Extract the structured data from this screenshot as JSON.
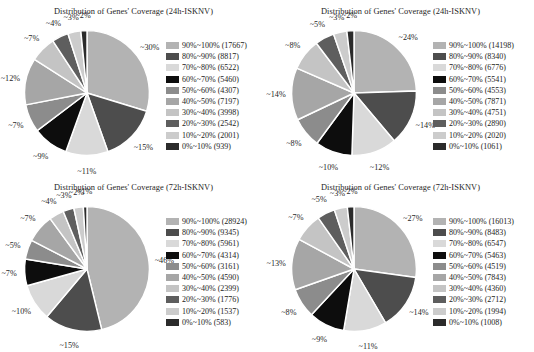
{
  "figure": {
    "background": "#ffffff",
    "label_prefix": "~",
    "panel_count": 4
  },
  "palette": {
    "c90_100": "#b3b3b3",
    "c80_90": "#4d4d4d",
    "c70_80": "#d9d9d9",
    "c60_70": "#0d0d0d",
    "c50_60": "#8c8c8c",
    "c40_50": "#a6a6a6",
    "c30_40": "#c4c4c4",
    "c20_30": "#5e5e5e",
    "c10_20": "#cccccc",
    "c0_10": "#2b2b2b"
  },
  "legend_categories": [
    "90%~100%",
    "80%~90%",
    "70%~80%",
    "60%~70%",
    "50%~60%",
    "40%~50%",
    "30%~40%",
    "20%~30%",
    "10%~20%",
    "0%~10%"
  ],
  "panels": [
    {
      "id": "panel-top-left",
      "title": "Distribution of Genes' Coverage (24h-ISKNV)",
      "legend": [
        {
          "label": "90%~100% (17667)",
          "color": "#b3b3b3"
        },
        {
          "label": "80%~90% (8817)",
          "color": "#4d4d4d"
        },
        {
          "label": "70%~80% (6522)",
          "color": "#d9d9d9"
        },
        {
          "label": "60%~70% (5460)",
          "color": "#0d0d0d"
        },
        {
          "label": "50%~60% (4307)",
          "color": "#8c8c8c"
        },
        {
          "label": "40%~50% (7197)",
          "color": "#a6a6a6"
        },
        {
          "label": "30%~40% (3998)",
          "color": "#c4c4c4"
        },
        {
          "label": "20%~30% (2542)",
          "color": "#5e5e5e"
        },
        {
          "label": "10%~20% (2001)",
          "color": "#cccccc"
        },
        {
          "label": "0%~10% (939)",
          "color": "#2b2b2b"
        }
      ],
      "slice_labels": [
        "~30%",
        "~2%",
        "~3%",
        "~4%",
        "~7%",
        "~12%",
        "~7%",
        "~9%",
        "~11%",
        "~15%"
      ]
    },
    {
      "id": "panel-top-right",
      "title": "Distribution of Genes' Coverage (24h-ISKNV)",
      "legend": [
        {
          "label": "90%~100% (14198)",
          "color": "#b3b3b3"
        },
        {
          "label": "80%~90% (8340)",
          "color": "#4d4d4d"
        },
        {
          "label": "70%~80% (6776)",
          "color": "#d9d9d9"
        },
        {
          "label": "60%~70% (5541)",
          "color": "#0d0d0d"
        },
        {
          "label": "50%~60% (4553)",
          "color": "#8c8c8c"
        },
        {
          "label": "40%~50% (7871)",
          "color": "#a6a6a6"
        },
        {
          "label": "30%~40% (4751)",
          "color": "#c4c4c4"
        },
        {
          "label": "20%~30% (2890)",
          "color": "#5e5e5e"
        },
        {
          "label": "10%~20% (2020)",
          "color": "#cccccc"
        },
        {
          "label": "0%~10% (1061)",
          "color": "#2b2b2b"
        }
      ],
      "slice_labels": [
        "~24%",
        "~2%",
        "~3%",
        "~5%",
        "~8%",
        "~14%",
        "~8%",
        "~10%",
        "~12%",
        "~14%"
      ]
    },
    {
      "id": "panel-bottom-left",
      "title": "Distribution of Genes' Coverage (72h-ISKNV)",
      "legend": [
        {
          "label": "90%~100% (28924)",
          "color": "#b3b3b3"
        },
        {
          "label": "80%~90% (9345)",
          "color": "#4d4d4d"
        },
        {
          "label": "70%~80% (5961)",
          "color": "#d9d9d9"
        },
        {
          "label": "60%~70% (4314)",
          "color": "#0d0d0d"
        },
        {
          "label": "50%~60% (3161)",
          "color": "#8c8c8c"
        },
        {
          "label": "40%~50% (4590)",
          "color": "#a6a6a6"
        },
        {
          "label": "30%~40% (2399)",
          "color": "#c4c4c4"
        },
        {
          "label": "20%~30% (1776)",
          "color": "#5e5e5e"
        },
        {
          "label": "10%~20% (1537)",
          "color": "#cccccc"
        },
        {
          "label": "0%~10% (583)",
          "color": "#2b2b2b"
        }
      ],
      "slice_labels": [
        "~46%",
        "~1%",
        "~2%",
        "~3%",
        "~4%",
        "~7%",
        "~5%",
        "~7%",
        "~10%",
        "~15%"
      ]
    },
    {
      "id": "panel-bottom-right",
      "title": "Distribution of Genes' Coverage (72h-ISKNV)",
      "legend": [
        {
          "label": "90%~100% (16013)",
          "color": "#b3b3b3"
        },
        {
          "label": "80%~90% (8483)",
          "color": "#4d4d4d"
        },
        {
          "label": "70%~80% (6547)",
          "color": "#d9d9d9"
        },
        {
          "label": "60%~70% (5463)",
          "color": "#0d0d0d"
        },
        {
          "label": "50%~60% (4519)",
          "color": "#8c8c8c"
        },
        {
          "label": "40%~50% (7843)",
          "color": "#a6a6a6"
        },
        {
          "label": "30%~40% (4360)",
          "color": "#c4c4c4"
        },
        {
          "label": "20%~30% (2712)",
          "color": "#5e5e5e"
        },
        {
          "label": "10%~20% (1994)",
          "color": "#cccccc"
        },
        {
          "label": "0%~10% (1008)",
          "color": "#2b2b2b"
        }
      ],
      "slice_labels": [
        "~27%",
        "~2%",
        "~3%",
        "~5%",
        "~7%",
        "~13%",
        "~8%",
        "~9%",
        "~11%",
        "~14%"
      ]
    }
  ],
  "chart_data": [
    {
      "type": "pie",
      "title": "Distribution of Genes' Coverage (24h-ISKNV)",
      "position": "top-left",
      "categories": [
        "90%~100%",
        "80%~90%",
        "70%~80%",
        "60%~70%",
        "50%~60%",
        "40%~50%",
        "30%~40%",
        "20%~30%",
        "10%~20%",
        "0%~10%"
      ],
      "values": [
        17667,
        8817,
        6522,
        5460,
        4307,
        7197,
        3998,
        2542,
        2001,
        939
      ],
      "percent_labels": [
        "~30%",
        "~15%",
        "~11%",
        "~9%",
        "~7%",
        "~12%",
        "~7%",
        "~4%",
        "~3%",
        "~2%"
      ],
      "percents": [
        30,
        15,
        11,
        9,
        7,
        12,
        7,
        4,
        3,
        2
      ],
      "total": 59450,
      "colors": [
        "#b3b3b3",
        "#4d4d4d",
        "#d9d9d9",
        "#0d0d0d",
        "#8c8c8c",
        "#a6a6a6",
        "#c4c4c4",
        "#5e5e5e",
        "#cccccc",
        "#2b2b2b"
      ],
      "legend_position": "right",
      "start_angle_deg": -90,
      "direction": "clockwise",
      "xlabel": "",
      "ylabel": ""
    },
    {
      "type": "pie",
      "title": "Distribution of Genes' Coverage (24h-ISKNV)",
      "position": "top-right",
      "categories": [
        "90%~100%",
        "80%~90%",
        "70%~80%",
        "60%~70%",
        "50%~60%",
        "40%~50%",
        "30%~40%",
        "20%~30%",
        "10%~20%",
        "0%~10%"
      ],
      "values": [
        14198,
        8340,
        6776,
        5541,
        4553,
        7871,
        4751,
        2890,
        2020,
        1061
      ],
      "percent_labels": [
        "~24%",
        "~14%",
        "~12%",
        "~10%",
        "~8%",
        "~14%",
        "~8%",
        "~5%",
        "~3%",
        "~2%"
      ],
      "percents": [
        24,
        14,
        12,
        10,
        8,
        14,
        8,
        5,
        3,
        2
      ],
      "total": 58001,
      "colors": [
        "#b3b3b3",
        "#4d4d4d",
        "#d9d9d9",
        "#0d0d0d",
        "#8c8c8c",
        "#a6a6a6",
        "#c4c4c4",
        "#5e5e5e",
        "#cccccc",
        "#2b2b2b"
      ],
      "legend_position": "right",
      "start_angle_deg": -90,
      "direction": "clockwise",
      "xlabel": "",
      "ylabel": ""
    },
    {
      "type": "pie",
      "title": "Distribution of Genes' Coverage (72h-ISKNV)",
      "position": "bottom-left",
      "categories": [
        "90%~100%",
        "80%~90%",
        "70%~80%",
        "60%~70%",
        "50%~60%",
        "40%~50%",
        "30%~40%",
        "20%~30%",
        "10%~20%",
        "0%~10%"
      ],
      "values": [
        28924,
        9345,
        5961,
        4314,
        3161,
        4590,
        2399,
        1776,
        1537,
        583
      ],
      "percent_labels": [
        "~46%",
        "~15%",
        "~10%",
        "~7%",
        "~5%",
        "~7%",
        "~4%",
        "~3%",
        "~2%",
        "~1%"
      ],
      "percents": [
        46,
        15,
        10,
        7,
        5,
        7,
        4,
        3,
        2,
        1
      ],
      "total": 62590,
      "colors": [
        "#b3b3b3",
        "#4d4d4d",
        "#d9d9d9",
        "#0d0d0d",
        "#8c8c8c",
        "#a6a6a6",
        "#c4c4c4",
        "#5e5e5e",
        "#cccccc",
        "#2b2b2b"
      ],
      "legend_position": "right",
      "start_angle_deg": -90,
      "direction": "clockwise",
      "xlabel": "",
      "ylabel": ""
    },
    {
      "type": "pie",
      "title": "Distribution of Genes' Coverage (72h-ISKNV)",
      "position": "bottom-right",
      "categories": [
        "90%~100%",
        "80%~90%",
        "70%~80%",
        "60%~70%",
        "50%~60%",
        "40%~50%",
        "30%~40%",
        "20%~30%",
        "10%~20%",
        "0%~10%"
      ],
      "values": [
        16013,
        8483,
        6547,
        5463,
        4519,
        7843,
        4360,
        2712,
        1994,
        1008
      ],
      "percent_labels": [
        "~27%",
        "~14%",
        "~11%",
        "~9%",
        "~8%",
        "~13%",
        "~7%",
        "~5%",
        "~3%",
        "~2%"
      ],
      "percents": [
        27,
        14,
        11,
        9,
        8,
        13,
        7,
        5,
        3,
        2
      ],
      "total": 58942,
      "colors": [
        "#b3b3b3",
        "#4d4d4d",
        "#d9d9d9",
        "#0d0d0d",
        "#8c8c8c",
        "#a6a6a6",
        "#c4c4c4",
        "#5e5e5e",
        "#cccccc",
        "#2b2b2b"
      ],
      "legend_position": "right",
      "start_angle_deg": -90,
      "direction": "clockwise",
      "xlabel": "",
      "ylabel": ""
    }
  ]
}
